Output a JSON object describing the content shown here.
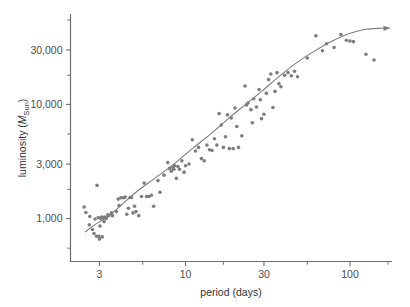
{
  "chart_data": {
    "type": "scatter",
    "title": "",
    "xlabel": "period (days)",
    "ylabel": "luminosity (M_Sun)",
    "ylabel_parts": {
      "prefix": "luminosity (",
      "italic": "M",
      "subscript": "Sun",
      "suffix": ")"
    },
    "xscale": "log",
    "yscale": "log",
    "xlim": [
      2.0,
      180
    ],
    "ylim": [
      420,
      62000
    ],
    "grid": false,
    "legend": null,
    "x_major_ticks": [
      3,
      10,
      30,
      100
    ],
    "x_major_tick_labels": [
      "3",
      "10",
      "30",
      "100"
    ],
    "x_minor_ticks": [
      5.5,
      17,
      55,
      170
    ],
    "y_major_ticks": [
      1000,
      3000,
      10000,
      30000
    ],
    "y_major_tick_labels": [
      "1,000",
      "3,000",
      "10,000",
      "30,000"
    ],
    "y_minor_ticks": [
      550,
      1800,
      5500,
      18000,
      55000
    ],
    "marker": {
      "shape": "circle",
      "color": "#7d7d7d",
      "size_px": 3.6
    },
    "fit_curve": {
      "label": "period-luminosity fit",
      "color": "#7d7d7d",
      "width_px": 1.1,
      "arrow_end": true,
      "points": [
        [
          2.45,
          760
        ],
        [
          2.8,
          880
        ],
        [
          3.3,
          1020
        ],
        [
          4.0,
          1280
        ],
        [
          5.0,
          1700
        ],
        [
          6.5,
          2250
        ],
        [
          8.5,
          3000
        ],
        [
          11.0,
          4100
        ],
        [
          14.0,
          5400
        ],
        [
          18.0,
          7400
        ],
        [
          23.0,
          9900
        ],
        [
          29.0,
          13000
        ],
        [
          37.0,
          17500
        ],
        [
          47.0,
          23000
        ],
        [
          60.0,
          29000
        ],
        [
          78.0,
          36000
        ],
        [
          100.0,
          42000
        ],
        [
          125.0,
          45500
        ],
        [
          155.0,
          46500
        ],
        [
          175.0,
          46800
        ]
      ]
    },
    "points": [
      [
        2.42,
        1260
      ],
      [
        2.48,
        1130
      ],
      [
        2.6,
        880
      ],
      [
        2.62,
        1040
      ],
      [
        2.72,
        800
      ],
      [
        2.78,
        740
      ],
      [
        2.82,
        990
      ],
      [
        2.88,
        700
      ],
      [
        2.9,
        1950
      ],
      [
        2.95,
        1020
      ],
      [
        2.98,
        700
      ],
      [
        3.0,
        660
      ],
      [
        3.02,
        860
      ],
      [
        3.05,
        1000
      ],
      [
        3.1,
        1030
      ],
      [
        3.12,
        690
      ],
      [
        3.18,
        1020
      ],
      [
        3.2,
        940
      ],
      [
        3.25,
        1030
      ],
      [
        3.3,
        1000
      ],
      [
        3.38,
        1080
      ],
      [
        3.42,
        1060
      ],
      [
        3.55,
        1120
      ],
      [
        3.6,
        1060
      ],
      [
        3.8,
        1150
      ],
      [
        3.9,
        1480
      ],
      [
        3.95,
        1300
      ],
      [
        4.05,
        1520
      ],
      [
        4.2,
        1520
      ],
      [
        4.3,
        1540
      ],
      [
        4.4,
        1090
      ],
      [
        4.5,
        1230
      ],
      [
        4.6,
        1530
      ],
      [
        4.7,
        1530
      ],
      [
        4.8,
        1120
      ],
      [
        4.9,
        1280
      ],
      [
        5.0,
        1150
      ],
      [
        5.2,
        1060
      ],
      [
        5.4,
        1560
      ],
      [
        5.6,
        2050
      ],
      [
        5.8,
        1560
      ],
      [
        6.0,
        1560
      ],
      [
        6.2,
        1600
      ],
      [
        6.4,
        1280
      ],
      [
        6.8,
        2150
      ],
      [
        7.0,
        1700
      ],
      [
        7.4,
        2400
      ],
      [
        7.8,
        3100
      ],
      [
        8.0,
        2750
      ],
      [
        8.2,
        2600
      ],
      [
        8.4,
        2800
      ],
      [
        8.5,
        2700
      ],
      [
        8.6,
        2900
      ],
      [
        8.8,
        2250
      ],
      [
        9.0,
        2850
      ],
      [
        9.2,
        2700
      ],
      [
        9.5,
        3200
      ],
      [
        9.8,
        2550
      ],
      [
        10.0,
        2900
      ],
      [
        10.5,
        3000
      ],
      [
        11.0,
        4900
      ],
      [
        11.5,
        3900
      ],
      [
        12.0,
        4200
      ],
      [
        12.5,
        3350
      ],
      [
        13.0,
        3200
      ],
      [
        13.5,
        4400
      ],
      [
        14.0,
        4000
      ],
      [
        14.5,
        3950
      ],
      [
        15.0,
        5000
      ],
      [
        15.5,
        4400
      ],
      [
        16.0,
        8300
      ],
      [
        16.5,
        6600
      ],
      [
        17.0,
        4200
      ],
      [
        17.5,
        5200
      ],
      [
        18.0,
        8100
      ],
      [
        18.5,
        4100
      ],
      [
        19.0,
        7600
      ],
      [
        19.5,
        4100
      ],
      [
        20.0,
        9300
      ],
      [
        20.5,
        6400
      ],
      [
        21.0,
        4200
      ],
      [
        22.0,
        5300
      ],
      [
        23.0,
        14500
      ],
      [
        23.5,
        9900
      ],
      [
        24.0,
        10300
      ],
      [
        25.0,
        9000
      ],
      [
        25.5,
        6900
      ],
      [
        26.0,
        11200
      ],
      [
        27.0,
        9500
      ],
      [
        28.0,
        13500
      ],
      [
        28.5,
        11000
      ],
      [
        29.0,
        7500
      ],
      [
        30.0,
        8200
      ],
      [
        31.0,
        12500
      ],
      [
        32.0,
        16500
      ],
      [
        33.0,
        18500
      ],
      [
        34.0,
        9400
      ],
      [
        35.0,
        13000
      ],
      [
        36.0,
        19000
      ],
      [
        37.0,
        15200
      ],
      [
        38.0,
        14300
      ],
      [
        40.0,
        18000
      ],
      [
        42.0,
        19000
      ],
      [
        44.0,
        17800
      ],
      [
        46.0,
        19500
      ],
      [
        48.0,
        17500
      ],
      [
        55.0,
        25500
      ],
      [
        62.0,
        40000
      ],
      [
        68.0,
        29500
      ],
      [
        72.0,
        34000
      ],
      [
        80.0,
        31500
      ],
      [
        88.0,
        41000
      ],
      [
        95.0,
        36500
      ],
      [
        100.0,
        36000
      ],
      [
        105.0,
        35500
      ],
      [
        125.0,
        27500
      ],
      [
        140.0,
        24500
      ]
    ]
  }
}
